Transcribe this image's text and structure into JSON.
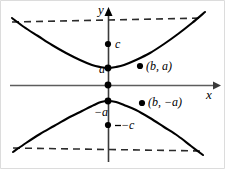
{
  "figure": {
    "colors": {
      "curve": "#000000",
      "asymptote": "#2b2b2b",
      "axis": "#575757",
      "y_axis": "#3a3a3a",
      "point": "#000000",
      "border": "#cfcfcf",
      "background": "#ffffff"
    }
  },
  "axes": {
    "x_label": "x",
    "y_label": "y",
    "origin": {
      "x": 108,
      "y": 85
    }
  },
  "labels": {
    "focus_upper": "c",
    "vertex_upper": "a",
    "vertex_lower": "−a",
    "focus_lower": "−c",
    "point_upper": "(b, a)",
    "point_lower": "(b, −a)"
  },
  "chart_data": {
    "type": "line",
    "title": "",
    "xlabel": "x",
    "ylabel": "y",
    "grid": false,
    "legend": "none",
    "xlim": [
      -98,
      107
    ],
    "ylim": [
      -84,
      77
    ],
    "curves": [
      {
        "name": "upper branch",
        "equation": "y^2/a^2 - x^2/b^2 = 1, y > 0",
        "points_px": [
          [
            12,
            18
          ],
          [
            24,
            27
          ],
          [
            38,
            36
          ],
          [
            52,
            45
          ],
          [
            66,
            53
          ],
          [
            80,
            60
          ],
          [
            92,
            65
          ],
          [
            100,
            67
          ],
          [
            108,
            68
          ],
          [
            116,
            67
          ],
          [
            124,
            65
          ],
          [
            136,
            60
          ],
          [
            150,
            53
          ],
          [
            164,
            44
          ],
          [
            178,
            34
          ],
          [
            192,
            23
          ],
          [
            205,
            12
          ]
        ]
      },
      {
        "name": "lower branch",
        "equation": "y^2/a^2 - x^2/b^2 = 1, y < 0",
        "points_px": [
          [
            13,
            152
          ],
          [
            26,
            143
          ],
          [
            40,
            134
          ],
          [
            54,
            126
          ],
          [
            68,
            118
          ],
          [
            82,
            111
          ],
          [
            94,
            105
          ],
          [
            101,
            102
          ],
          [
            108,
            101
          ],
          [
            116,
            102
          ],
          [
            124,
            105
          ],
          [
            136,
            110
          ],
          [
            150,
            118
          ],
          [
            164,
            127
          ],
          [
            178,
            136
          ],
          [
            191,
            146
          ],
          [
            203,
            155
          ]
        ]
      }
    ],
    "asymptotes": [
      {
        "name": "positive slope asymptote",
        "equation": "y = (a/b) x",
        "from_px": [
          12,
          22
        ],
        "to_px": [
          204,
          18
        ],
        "note": "passes through origin; drawn dashed"
      },
      {
        "name": "negative slope asymptote",
        "equation": "y = -(a/b) x",
        "from_px": [
          13,
          148
        ],
        "to_px": [
          203,
          151
        ],
        "note": "passes through origin; drawn dashed"
      }
    ],
    "marked_points": [
      {
        "label": "c",
        "px": [
          108,
          44
        ],
        "kind": "focus"
      },
      {
        "label": "a",
        "px": [
          108,
          68
        ],
        "kind": "vertex"
      },
      {
        "label": "origin",
        "px": [
          108,
          85
        ],
        "kind": "origin"
      },
      {
        "label": "−a",
        "px": [
          108,
          101
        ],
        "kind": "vertex"
      },
      {
        "label": "−c",
        "px": [
          108,
          125
        ],
        "kind": "focus"
      },
      {
        "label": "(b, a)",
        "px": [
          140,
          66
        ],
        "kind": "point"
      },
      {
        "label": "(b, −a)",
        "px": [
          142,
          103
        ],
        "kind": "point"
      }
    ]
  }
}
